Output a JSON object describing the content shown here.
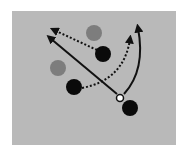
{
  "diagram": {
    "title": "Play diagram",
    "colors": {
      "background": "#ffffff",
      "field": "#b9b9b9",
      "offense": "#0a0a0a",
      "defense": "#7d7d7d",
      "ball_fill": "#ffffff",
      "ball_stroke": "#111111",
      "line": "#111111"
    },
    "field": {
      "x": 12,
      "y": 11,
      "width": 164,
      "height": 134
    },
    "players": [
      {
        "id": "defender-1",
        "team": "defense",
        "cx": 94,
        "cy": 33,
        "r": 8
      },
      {
        "id": "defender-2",
        "team": "defense",
        "cx": 58,
        "cy": 68,
        "r": 8
      },
      {
        "id": "offense-1",
        "team": "offense",
        "cx": 103,
        "cy": 54,
        "r": 8
      },
      {
        "id": "offense-2",
        "team": "offense",
        "cx": 74,
        "cy": 87,
        "r": 8
      },
      {
        "id": "offense-3",
        "team": "offense",
        "cx": 130,
        "cy": 108,
        "r": 8
      }
    ],
    "ball": {
      "cx": 120,
      "cy": 98,
      "r": 3.5
    },
    "paths": [
      {
        "id": "pass-straight",
        "style": "solid",
        "d": "M117 94 L50 38"
      },
      {
        "id": "pass-curve",
        "style": "solid",
        "d": "M124 94 Q146 70 138 28"
      },
      {
        "id": "run-upper",
        "style": "dotted",
        "d": "M97 50 L54 30"
      },
      {
        "id": "run-lower",
        "style": "dotted",
        "d": "M82 88 Q124 80 130 39"
      }
    ]
  }
}
